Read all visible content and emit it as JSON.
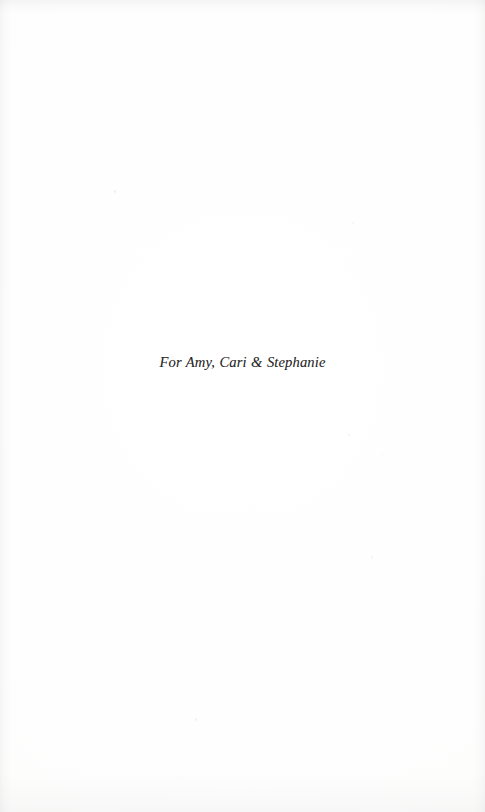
{
  "page": {
    "kind": "book-dedication-page",
    "background_color": "#fefefe",
    "ink_color": "#2a2a2a"
  },
  "dedication": {
    "text": "For Amy, Cari & Stephanie"
  }
}
